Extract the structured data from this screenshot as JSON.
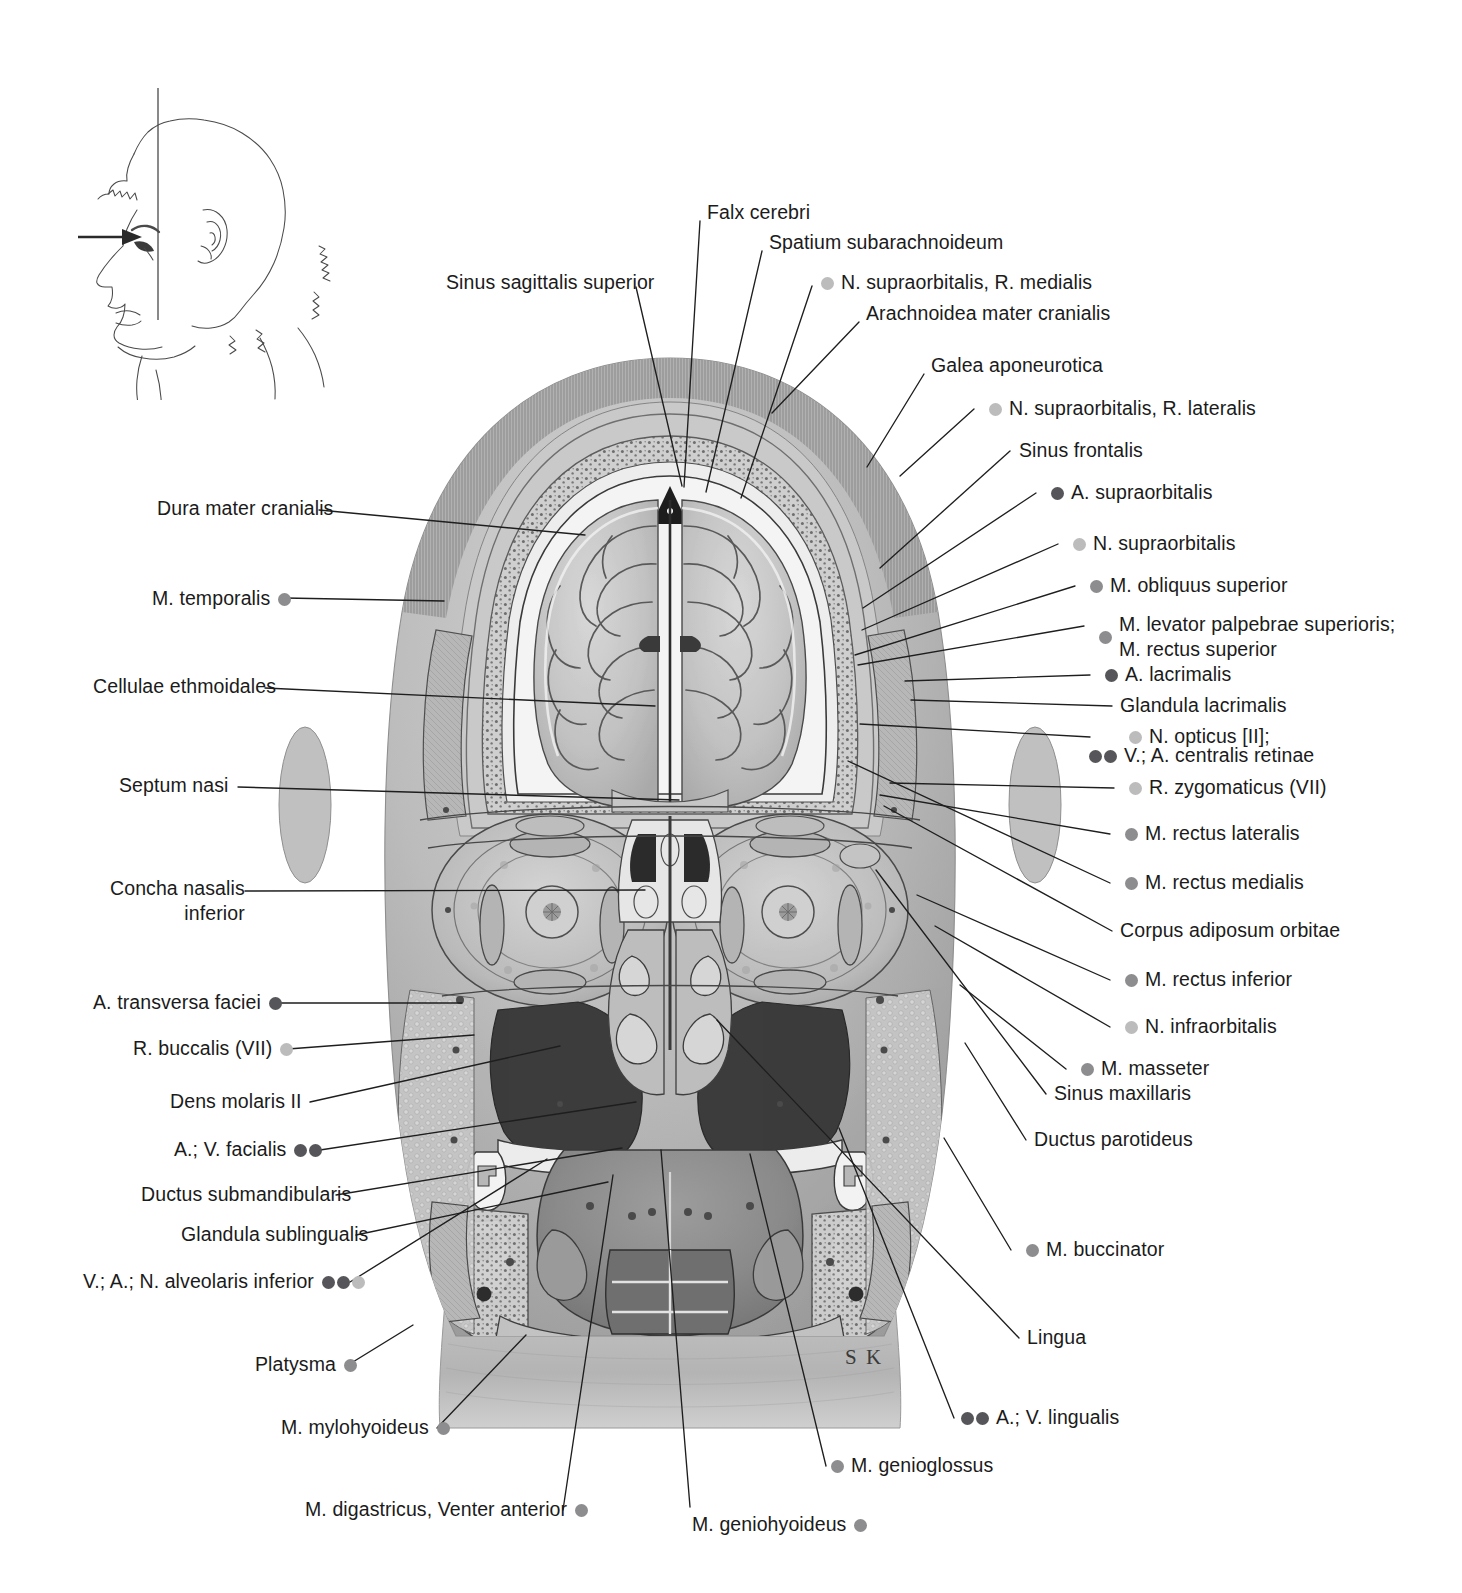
{
  "plate": {
    "title": "Coronal section through the head",
    "signature": "S K",
    "background": "#ffffff"
  },
  "legend_colors": {
    "artery": "#56565a",
    "nerve": "#bcbcbc",
    "muscle": "#8d8d8f"
  },
  "orientation_key": {
    "name": "head-orientation-key",
    "description": "Lateral head outline with vertical section plane and viewing-direction arrow",
    "arrow_direction": "right"
  },
  "labels_top": [
    {
      "text": "Falx cerebri",
      "bullets": [],
      "side": "right",
      "x": 707,
      "y": 199,
      "line": [
        [
          700,
          221
        ],
        [
          684,
          487
        ]
      ]
    },
    {
      "text": "Spatium subarachnoideum",
      "bullets": [],
      "side": "right",
      "x": 769,
      "y": 229,
      "line": [
        [
          762,
          251
        ],
        [
          706,
          492
        ]
      ]
    },
    {
      "text": "N. supraorbitalis, R. medialis",
      "bullets": [
        "nerve"
      ],
      "side": "right",
      "x": 820,
      "y": 269,
      "line": [
        [
          812,
          286
        ],
        [
          741,
          498
        ]
      ]
    },
    {
      "text": "Arachnoidea mater cranialis",
      "bullets": [],
      "side": "right",
      "x": 866,
      "y": 300,
      "line": [
        [
          859,
          322
        ],
        [
          772,
          413
        ]
      ]
    },
    {
      "text": "Galea aponeurotica",
      "bullets": [],
      "side": "right",
      "x": 931,
      "y": 352,
      "line": [
        [
          924,
          374
        ],
        [
          867,
          467
        ]
      ]
    }
  ],
  "labels_right": [
    {
      "text": "N. supraorbitalis, R. laterais_placeholder",
      "bullets": [],
      "side": "right",
      "x": 0,
      "y": 0,
      "line": []
    }
  ],
  "labels_right_column": [
    {
      "text": "N. supraorbitalis, R. lateralis",
      "bullets": [
        "nerve"
      ],
      "x": 988,
      "y": 395,
      "line": [
        [
          974,
          409
        ],
        [
          900,
          476
        ]
      ]
    },
    {
      "text": "Sinus frontalis",
      "bullets": [],
      "x": 1019,
      "y": 437,
      "line": [
        [
          1010,
          451
        ],
        [
          880,
          568
        ]
      ]
    },
    {
      "text": "A. supraorbitalis",
      "bullets": [
        "artery"
      ],
      "x": 1050,
      "y": 479,
      "line": [
        [
          1036,
          493
        ],
        [
          863,
          608
        ]
      ]
    },
    {
      "text": "N. supraorbitalis",
      "bullets": [
        "nerve"
      ],
      "x": 1072,
      "y": 530,
      "line": [
        [
          1058,
          544
        ],
        [
          862,
          630
        ]
      ]
    },
    {
      "text": "M. obliquus superior",
      "bullets": [
        "muscle"
      ],
      "x": 1089,
      "y": 572,
      "line": [
        [
          1075,
          586
        ],
        [
          855,
          655
        ]
      ]
    },
    {
      "text": "M. levator palpebrae superioris;",
      "text2": "M. rectus superior",
      "bullets": [
        "muscle"
      ],
      "x": 1098,
      "y": 612,
      "line": [
        [
          1084,
          626
        ],
        [
          858,
          665
        ]
      ]
    },
    {
      "text": "A. lacrimalis",
      "bullets": [
        "artery"
      ],
      "x": 1104,
      "y": 661,
      "line": [
        [
          1090,
          675
        ],
        [
          905,
          681
        ]
      ]
    },
    {
      "text": "Glandula lacrimalis",
      "bullets": [],
      "x": 1120,
      "y": 692,
      "line": [
        [
          1112,
          706
        ],
        [
          911,
          700
        ]
      ]
    },
    {
      "text": "N. opticus [II];",
      "bullets": [
        "nerve"
      ],
      "x": 1128,
      "y": 723,
      "line": [
        [
          1090,
          737
        ],
        [
          860,
          724
        ]
      ]
    },
    {
      "text": "V.; A. centralis retinae",
      "bullets": [
        "artery",
        "artery"
      ],
      "x": 1088,
      "y": 742,
      "noline": true
    },
    {
      "text": "R. zygomaticus (VII)",
      "bullets": [
        "nerve"
      ],
      "x": 1128,
      "y": 774,
      "line": [
        [
          1114,
          788
        ],
        [
          890,
          783
        ]
      ]
    },
    {
      "text": "M. rectus lateralis",
      "bullets": [
        "muscle"
      ],
      "x": 1124,
      "y": 820,
      "line": [
        [
          1110,
          834
        ],
        [
          880,
          795
        ]
      ]
    },
    {
      "text": "M. rectus medialis",
      "bullets": [
        "muscle"
      ],
      "x": 1124,
      "y": 869,
      "line": [
        [
          1110,
          883
        ],
        [
          848,
          761
        ]
      ]
    },
    {
      "text": "Corpus adiposum orbitae",
      "bullets": [],
      "x": 1120,
      "y": 917,
      "line": [
        [
          1112,
          931
        ],
        [
          884,
          806
        ]
      ]
    },
    {
      "text": "M. rectus inferior",
      "bullets": [
        "muscle"
      ],
      "x": 1124,
      "y": 966,
      "line": [
        [
          1110,
          980
        ],
        [
          917,
          895
        ]
      ]
    },
    {
      "text": "N. infraorbitalis",
      "bullets": [
        "nerve"
      ],
      "x": 1124,
      "y": 1013,
      "line": [
        [
          1110,
          1027
        ],
        [
          935,
          926
        ]
      ]
    },
    {
      "text": "M. masseter",
      "bullets": [
        "muscle"
      ],
      "x": 1080,
      "y": 1055,
      "line": [
        [
          1066,
          1069
        ],
        [
          960,
          985
        ]
      ]
    },
    {
      "text": "Sinus maxillaris",
      "bullets": [],
      "x": 1054,
      "y": 1080,
      "line": [
        [
          1046,
          1094
        ],
        [
          876,
          870
        ]
      ]
    },
    {
      "text": "Ductus parotideus",
      "bullets": [],
      "x": 1034,
      "y": 1126,
      "line": [
        [
          1026,
          1140
        ],
        [
          965,
          1043
        ]
      ]
    },
    {
      "text": "M. buccinator",
      "bullets": [
        "muscle"
      ],
      "x": 1025,
      "y": 1236,
      "line": [
        [
          1011,
          1250
        ],
        [
          944,
          1138
        ]
      ]
    },
    {
      "text": "Lingua",
      "bullets": [],
      "x": 1027,
      "y": 1324,
      "line": [
        [
          1019,
          1338
        ],
        [
          717,
          1020
        ]
      ]
    },
    {
      "text": "A.; V. lingualis",
      "bullets": [
        "artery",
        "artery"
      ],
      "x": 960,
      "y": 1404,
      "line": [
        [
          954,
          1418
        ],
        [
          839,
          1128
        ]
      ]
    },
    {
      "text": "M. genioglossus",
      "bullets": [
        "muscle"
      ],
      "x": 830,
      "y": 1452,
      "line": [
        [
          826,
          1466
        ],
        [
          750,
          1154
        ]
      ]
    }
  ],
  "labels_left_column": [
    {
      "text": "Sinus sagittalis superior",
      "bullets": [],
      "x": 446,
      "y": 269,
      "align": "left-of-point",
      "line": [
        [
          636,
          287
        ],
        [
          682,
          486
        ]
      ]
    },
    {
      "text": "Dura mater cranialis",
      "bullets": [],
      "x": 157,
      "y": 495,
      "line": [
        [
          319,
          510
        ],
        [
          585,
          535
        ]
      ]
    },
    {
      "text": "M. temporalis",
      "bullets": [
        "muscle"
      ],
      "x": 152,
      "y": 585,
      "line": [
        [
          285,
          598
        ],
        [
          444,
          601
        ]
      ]
    },
    {
      "text": "Cellulae ethmoidales",
      "bullets": [],
      "x": 93,
      "y": 673,
      "line": [
        [
          265,
          688
        ],
        [
          655,
          706
        ]
      ]
    },
    {
      "text": "Septum nasi",
      "bullets": [],
      "x": 119,
      "y": 772,
      "line": [
        [
          238,
          787
        ],
        [
          679,
          800
        ]
      ]
    },
    {
      "text": "Concha nasalis",
      "text2": "inferior",
      "bullets": [],
      "x": 110,
      "y": 876,
      "line": [
        [
          245,
          891
        ],
        [
          645,
          890
        ]
      ]
    },
    {
      "text": "A. transversa faciei",
      "bullets": [
        "artery"
      ],
      "x": 93,
      "y": 989,
      "line": [
        [
          276,
          1003
        ],
        [
          462,
          1003
        ]
      ]
    },
    {
      "text": "R. buccalis (VII)",
      "bullets": [
        "nerve"
      ],
      "x": 133,
      "y": 1035,
      "line": [
        [
          288,
          1049
        ],
        [
          474,
          1035
        ]
      ]
    },
    {
      "text": "Dens molaris II",
      "bullets": [],
      "x": 170,
      "y": 1088,
      "line": [
        [
          310,
          1102
        ],
        [
          560,
          1046
        ]
      ]
    },
    {
      "text": "A.; V. facialis",
      "bullets": [
        "artery",
        "artery"
      ],
      "x": 174,
      "y": 1136,
      "line": [
        [
          320,
          1150
        ],
        [
          636,
          1102
        ]
      ]
    },
    {
      "text": "Ductus submandibularis",
      "bullets": [],
      "x": 141,
      "y": 1181,
      "line": [
        [
          336,
          1195
        ],
        [
          622,
          1148
        ]
      ]
    },
    {
      "text": "Glandula sublingualis",
      "bullets": [],
      "x": 181,
      "y": 1221,
      "line": [
        [
          356,
          1235
        ],
        [
          608,
          1182
        ]
      ]
    },
    {
      "text": "V.; A.; N. alveolaris inferior",
      "bullets": [
        "artery",
        "artery",
        "nerve"
      ],
      "x": 83,
      "y": 1268,
      "line": [
        [
          350,
          1282
        ],
        [
          547,
          1159
        ]
      ]
    },
    {
      "text": "Platysma",
      "bullets": [
        "muscle"
      ],
      "x": 255,
      "y": 1351,
      "line": [
        [
          348,
          1365
        ],
        [
          413,
          1325
        ]
      ]
    },
    {
      "text": "M. mylohyoideus",
      "bullets": [
        "muscle"
      ],
      "x": 281,
      "y": 1414,
      "line": [
        [
          437,
          1428
        ],
        [
          526,
          1335
        ]
      ]
    },
    {
      "text": "M. digastricus, Venter anterior",
      "bullets": [
        "muscle"
      ],
      "x": 305,
      "y": 1496,
      "line": [
        [
          563,
          1510
        ],
        [
          613,
          1175
        ]
      ]
    },
    {
      "text": "M. geniohyoideus",
      "bullets": [
        "muscle"
      ],
      "x": 692,
      "y": 1511,
      "line": [
        [
          690,
          1507
        ],
        [
          661,
          1150
        ]
      ]
    }
  ]
}
